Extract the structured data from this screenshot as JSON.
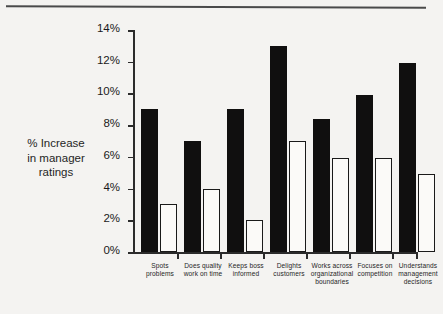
{
  "chart_data": {
    "type": "bar",
    "title": "",
    "xlabel": "",
    "ylabel": "% Increase in manager ratings",
    "ylim": [
      0,
      14
    ],
    "ytick_labels": [
      "14%",
      "12%",
      "10%",
      "8%",
      "6%",
      "4%",
      "2%",
      "0%"
    ],
    "yticks": [
      14,
      12,
      10,
      8,
      6,
      4,
      2,
      0
    ],
    "grid": false,
    "legend": "none",
    "categories": [
      "Spots problems",
      "Does quality work on time",
      "Keeps boss informed",
      "Delights customers",
      "Works across organizational boundaries",
      "Focuses on competition",
      "Understands management decisions"
    ],
    "category_lines": [
      [
        "Spots",
        "problems"
      ],
      [
        "Does quality",
        "work on time"
      ],
      [
        "Keeps boss",
        "informed"
      ],
      [
        "Delights",
        "customers"
      ],
      [
        "Works across",
        "organizational",
        "boundaries"
      ],
      [
        "Focuses on",
        "competition"
      ],
      [
        "Understands",
        "management",
        "decisions"
      ]
    ],
    "series": [
      {
        "name": "black-series",
        "color": "#100f0f",
        "values": [
          9.0,
          7.0,
          9.0,
          13.0,
          8.4,
          9.9,
          11.9
        ]
      },
      {
        "name": "white-series",
        "color": "#ffffff",
        "values": [
          3.0,
          4.0,
          2.0,
          7.0,
          5.9,
          5.9,
          4.9
        ]
      }
    ]
  },
  "axis_title_lines": [
    "% Increase",
    "in manager",
    "ratings"
  ]
}
